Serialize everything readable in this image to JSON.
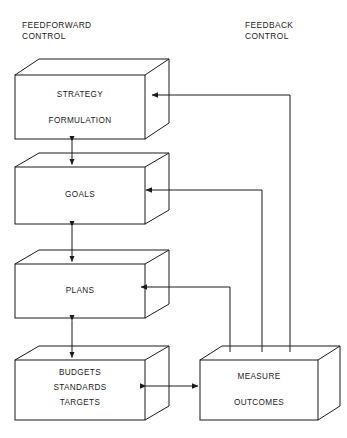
{
  "diagram": {
    "type": "block-flow-diagram",
    "title_visible": false,
    "stroke_color": "#1b1b1b",
    "background_color": "#ffffff",
    "corner_labels": {
      "feedforward": "FEEDFORWARD\nCONTROL",
      "feedforward_line1": "FEEDFORWARD",
      "feedforward_line2": "CONTROL",
      "feedback": "FEEDBACK\nCONTROL",
      "feedback_line1": "FEEDBACK",
      "feedback_line2": "CONTROL"
    },
    "nodes": [
      {
        "id": "strategy",
        "label_line1": "STRATEGY",
        "label_line2": "FORMULATION",
        "shape": "cuboid"
      },
      {
        "id": "goals",
        "label_line1": "GOALS",
        "label_line2": "",
        "shape": "cuboid"
      },
      {
        "id": "plans",
        "label_line1": "PLANS",
        "label_line2": "",
        "shape": "cuboid"
      },
      {
        "id": "budgets",
        "label_line1": "BUDGETS",
        "label_line2": "STANDARDS",
        "label_line3": "TARGETS",
        "shape": "cuboid"
      },
      {
        "id": "measure",
        "label_line1": "MEASURE",
        "label_line2": "OUTCOMES",
        "shape": "cuboid"
      }
    ],
    "edges": [
      {
        "id": "strategy-goals",
        "from": "strategy",
        "to": "goals",
        "style": "double-arrow-vertical"
      },
      {
        "id": "goals-plans",
        "from": "goals",
        "to": "plans",
        "style": "double-arrow-vertical"
      },
      {
        "id": "plans-budgets",
        "from": "plans",
        "to": "budgets",
        "style": "double-arrow-vertical"
      },
      {
        "id": "budgets-measure",
        "from": "budgets",
        "to": "measure",
        "style": "double-arrow-horizontal"
      },
      {
        "id": "measure-strategy",
        "from": "measure",
        "to": "strategy",
        "style": "feedback-routed"
      },
      {
        "id": "measure-goals",
        "from": "measure",
        "to": "goals",
        "style": "feedback-routed"
      },
      {
        "id": "measure-plans",
        "from": "measure",
        "to": "plans",
        "style": "feedback-routed"
      }
    ]
  }
}
